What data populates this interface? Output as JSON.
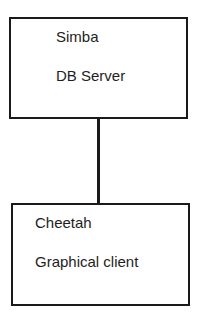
{
  "diagram": {
    "nodes": [
      {
        "id": "simba",
        "name": "Simba",
        "role": "DB Server"
      },
      {
        "id": "cheetah",
        "name": "Cheetah",
        "role": "Graphical client"
      }
    ],
    "edges": [
      {
        "from": "simba",
        "to": "cheetah"
      }
    ]
  }
}
